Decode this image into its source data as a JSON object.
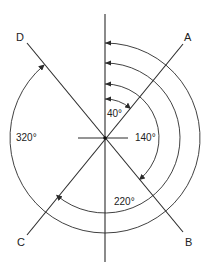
{
  "diagram": {
    "type": "bearing-diagram",
    "center": {
      "x": 105,
      "y": 138
    },
    "line_color": "#2b2b2b",
    "reference_line": {
      "name": "north-reference",
      "from_y": 14,
      "to_y": 262
    },
    "horizontal_tick": {
      "from_x": 78,
      "to_x": 128
    },
    "lines": [
      {
        "label": "A",
        "bearing": 40
      },
      {
        "label": "B",
        "bearing": 140
      },
      {
        "label": "C",
        "bearing": 220
      },
      {
        "label": "D",
        "bearing": 320
      }
    ],
    "angles": [
      {
        "label": "40°",
        "value": 40,
        "radius": 39,
        "target": "A"
      },
      {
        "label": "140°",
        "value": 140,
        "radius": 54,
        "target": "B"
      },
      {
        "label": "220°",
        "value": 220,
        "radius": 75,
        "target": "C"
      },
      {
        "label": "320°",
        "value": 320,
        "radius": 95,
        "target": "D"
      }
    ],
    "labels": {
      "A": "A",
      "B": "B",
      "C": "C",
      "D": "D",
      "a40": "40°",
      "a140": "140°",
      "a220": "220°",
      "a320": "320°"
    }
  }
}
